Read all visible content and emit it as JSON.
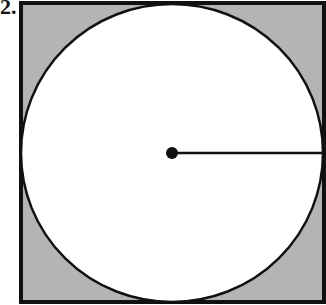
{
  "question": {
    "number_label": "2."
  },
  "diagram": {
    "shapes": [
      "square",
      "inscribed-circle",
      "center-point",
      "radius-segment"
    ],
    "colors": {
      "shaded_region": "#b4b4b4",
      "circle_fill": "#ffffff",
      "stroke": "#111111"
    }
  }
}
